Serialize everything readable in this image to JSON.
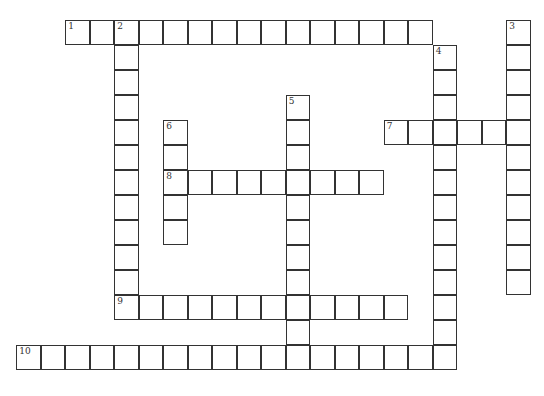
{
  "puzzle": {
    "title": "Crossword",
    "words": [
      {
        "number": "1",
        "direction": "across",
        "row": 0,
        "col": 2,
        "length": 15
      },
      {
        "number": "2",
        "direction": "down",
        "row": 0,
        "col": 4,
        "length": 12
      },
      {
        "number": "3",
        "direction": "down",
        "row": 0,
        "col": 20,
        "length": 11
      },
      {
        "number": "4",
        "direction": "down",
        "row": 1,
        "col": 17,
        "length": 13
      },
      {
        "number": "5",
        "direction": "down",
        "row": 3,
        "col": 11,
        "length": 11
      },
      {
        "number": "6",
        "direction": "down",
        "row": 4,
        "col": 6,
        "length": 5
      },
      {
        "number": "7",
        "direction": "across",
        "row": 4,
        "col": 15,
        "length": 6
      },
      {
        "number": "8",
        "direction": "across",
        "row": 6,
        "col": 6,
        "length": 9
      },
      {
        "number": "9",
        "direction": "across",
        "row": 11,
        "col": 4,
        "length": 12
      },
      {
        "number": "10",
        "direction": "across",
        "row": 13,
        "col": 0,
        "length": 18
      }
    ]
  }
}
